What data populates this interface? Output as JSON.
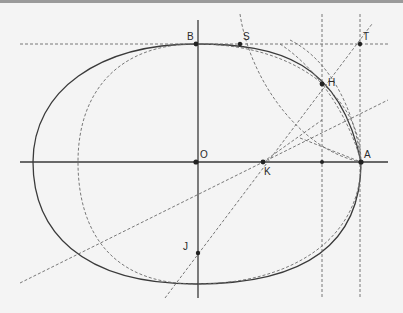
{
  "diagram": {
    "title": "",
    "points": [
      {
        "label": "B",
        "x": 196,
        "y": 44
      },
      {
        "label": "S",
        "x": 240,
        "y": 44
      },
      {
        "label": "T",
        "x": 360,
        "y": 44
      },
      {
        "label": "H",
        "x": 322,
        "y": 84
      },
      {
        "label": "O",
        "x": 196,
        "y": 162
      },
      {
        "label": "K",
        "x": 263,
        "y": 162
      },
      {
        "label": "A",
        "x": 361,
        "y": 162
      },
      {
        "label": "J",
        "x": 198,
        "y": 253
      }
    ],
    "colors": {
      "background": "#f4f4f4",
      "solid_stroke": "#3a3a3a",
      "dashed_stroke": "#6a6a6a"
    }
  }
}
